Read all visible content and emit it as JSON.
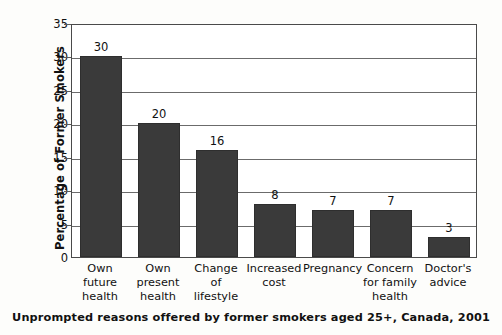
{
  "chart_data": {
    "type": "bar",
    "title": "",
    "subtitle": "",
    "caption": "Unprompted reasons offered by former smokers aged 25+, Canada, 2001",
    "xlabel": "",
    "ylabel": "Percentage of Former Smokers",
    "ylim": [
      0,
      35
    ],
    "ytick_step": 5,
    "yticks": [
      "0",
      "5",
      "10",
      "15",
      "20",
      "25",
      "30",
      "35"
    ],
    "grid": true,
    "legend": "none",
    "bar_color": "#3a3a3a",
    "background_color": "#fdfdfb",
    "plot_background_color": "#ffffff",
    "axis_color": "#4a4a4a",
    "categories": [
      "Own future health",
      "Own present health",
      "Change of lifestyle",
      "Increased cost",
      "Pregnancy",
      "Concern for family health",
      "Doctor's advice"
    ],
    "category_lines": [
      [
        "Own",
        "future",
        "health"
      ],
      [
        "Own",
        "present",
        "health"
      ],
      [
        "Change",
        "of",
        "lifestyle"
      ],
      [
        "Increased",
        "cost"
      ],
      [
        "Pregnancy"
      ],
      [
        "Concern",
        "for family",
        "health"
      ],
      [
        "Doctor's",
        "advice"
      ]
    ],
    "values": [
      30,
      20,
      16,
      8,
      7,
      7,
      3
    ],
    "value_labels": [
      "30",
      "20",
      "16",
      "8",
      "7",
      "7",
      "3"
    ]
  }
}
